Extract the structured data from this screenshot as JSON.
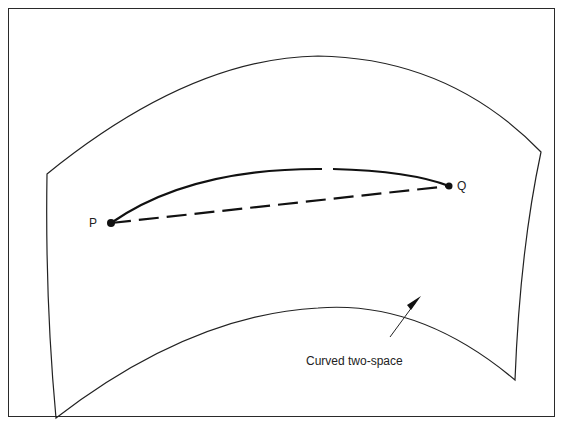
{
  "figure": {
    "type": "curved surface diagram",
    "points": [
      {
        "id": "P",
        "label": "P"
      },
      {
        "id": "Q",
        "label": "Q"
      }
    ],
    "paths": [
      {
        "name": "geodesic-curve",
        "style": "solid",
        "from": "P",
        "to": "Q"
      },
      {
        "name": "straight-chord",
        "style": "dashed",
        "from": "P",
        "to": "Q"
      }
    ],
    "caption": "Curved two-space",
    "colors": {
      "ink": "#222222",
      "background": "#ffffff"
    }
  }
}
